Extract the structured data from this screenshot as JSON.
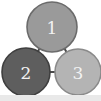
{
  "figure": {
    "width": 101,
    "height": 101,
    "background_color": "#ffffff",
    "bottom_strip_color": "#e9e9e9"
  },
  "graph": {
    "type": "undirected-triangle",
    "node_outline_color": "#5a5a5a",
    "label_color": "#f2f2f2",
    "edge_color": "#4a4a4a",
    "edge_width": 2,
    "interior_color": "#fdfdfd",
    "nodes": [
      {
        "id": "1",
        "label": "1",
        "cx": 52,
        "cy": 27,
        "r": 25,
        "fill": "#9a9a9a",
        "stroke": "#6b6b6b",
        "position": "top-center"
      },
      {
        "id": "2",
        "label": "2",
        "cx": 26,
        "cy": 72,
        "r": 24,
        "fill": "#5e5e5e",
        "stroke": "#3f3f3f",
        "position": "bottom-left"
      },
      {
        "id": "3",
        "label": "3",
        "cx": 78,
        "cy": 72,
        "r": 23,
        "fill": "#b4b4b4",
        "stroke": "#8a8a8a",
        "position": "bottom-right"
      }
    ],
    "edges": [
      {
        "id": "edge-1-2",
        "from": "1",
        "to": "2"
      },
      {
        "id": "edge-1-3",
        "from": "1",
        "to": "3"
      },
      {
        "id": "edge-2-3",
        "from": "2",
        "to": "3"
      }
    ]
  }
}
